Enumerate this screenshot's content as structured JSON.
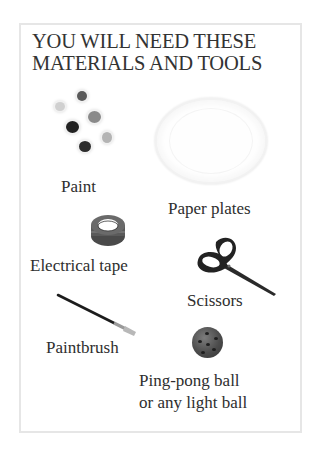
{
  "page": {
    "title_lines": [
      "YOU WILL NEED THESE",
      "MATERIALS AND TOOLS"
    ]
  },
  "items": [
    {
      "id": "paint",
      "label_lines": [
        "Paint"
      ],
      "icon": "paint-pots-icon"
    },
    {
      "id": "paper-plates",
      "label_lines": [
        "Paper plates"
      ],
      "icon": "paper-plate-icon"
    },
    {
      "id": "electrical-tape",
      "label_lines": [
        "Electrical tape"
      ],
      "icon": "tape-roll-icon"
    },
    {
      "id": "scissors",
      "label_lines": [
        "Scissors"
      ],
      "icon": "scissors-icon"
    },
    {
      "id": "paintbrush",
      "label_lines": [
        "Paintbrush"
      ],
      "icon": "paintbrush-icon"
    },
    {
      "id": "ping-pong-ball",
      "label_lines": [
        "Ping-pong ball",
        "or any light ball"
      ],
      "icon": "ball-icon"
    }
  ],
  "colors": {
    "frame_border": "#e6e6e6",
    "text": "#2e2e2e",
    "background": "#ffffff"
  }
}
